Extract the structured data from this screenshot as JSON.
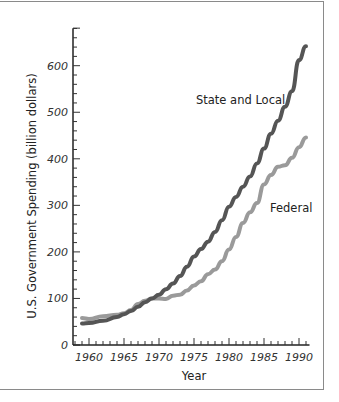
{
  "chart_data": {
    "type": "line",
    "title": "",
    "xlabel": "Year",
    "ylabel": "U.S. Government Spending (billion dollars)",
    "xlim": [
      1958,
      1991.5
    ],
    "ylim": [
      0,
      700
    ],
    "x_ticks": [
      1960,
      1965,
      1970,
      1975,
      1980,
      1985,
      1990
    ],
    "y_ticks": [
      0,
      100,
      200,
      300,
      400,
      500,
      600
    ],
    "grid": false,
    "legend": "inline labels",
    "x": [
      1959,
      1960,
      1962,
      1964,
      1965,
      1966,
      1967,
      1968,
      1969,
      1970,
      1971,
      1972,
      1973,
      1974,
      1975,
      1976,
      1977,
      1978,
      1979,
      1980,
      1981,
      1982,
      1983,
      1984,
      1985,
      1986,
      1987,
      1988,
      1989,
      1990,
      1991
    ],
    "series": [
      {
        "name": "State and Local",
        "color": "#555555",
        "values": [
          46,
          47,
          52,
          60,
          66,
          73,
          82,
          92,
          100,
          108,
          120,
          132,
          148,
          168,
          190,
          206,
          222,
          243,
          268,
          297,
          318,
          340,
          362,
          390,
          422,
          454,
          482,
          512,
          545,
          612,
          642
        ]
      },
      {
        "name": "Federal",
        "color": "#9a9a9a",
        "values": [
          58,
          56,
          62,
          65,
          68,
          75,
          88,
          95,
          100,
          100,
          99,
          106,
          108,
          117,
          128,
          137,
          152,
          162,
          180,
          205,
          232,
          262,
          285,
          305,
          345,
          365,
          383,
          386,
          402,
          425,
          446
        ]
      }
    ]
  },
  "labels": {
    "ylabel": "U.S. Government Spending (billion dollars)",
    "xlabel": "Year",
    "state": "State and Local",
    "federal": "Federal"
  }
}
